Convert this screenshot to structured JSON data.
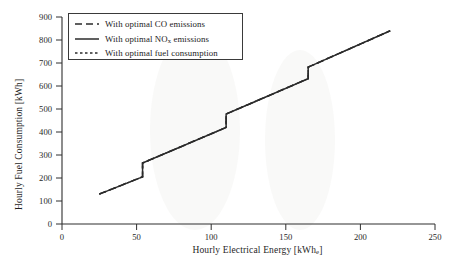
{
  "chart_data": {
    "type": "line",
    "title": "",
    "xlabel": "Hourly Electrical Energy [kWhe]",
    "ylabel": "Hourly Fuel Consumption [kWh]",
    "xlim": [
      0,
      250
    ],
    "ylim": [
      0,
      900
    ],
    "xticks": [
      0,
      50,
      100,
      150,
      200,
      250
    ],
    "yticks": [
      0,
      100,
      200,
      300,
      400,
      500,
      600,
      700,
      800,
      900
    ],
    "grid": false,
    "legend_position": "upper left",
    "series": [
      {
        "name": "With optimal CO emissions",
        "style": "dashed",
        "color": "#2b2b2b",
        "x": [
          25,
          54,
          54,
          110,
          110,
          165,
          165,
          220
        ],
        "y": [
          130,
          205,
          265,
          420,
          478,
          632,
          682,
          840
        ]
      },
      {
        "name": "With optimal NOx emissions",
        "style": "solid",
        "color": "#2b2b2b",
        "x": [
          25,
          54,
          54,
          110,
          110,
          165,
          165,
          220
        ],
        "y": [
          130,
          205,
          265,
          420,
          478,
          632,
          682,
          840
        ]
      },
      {
        "name": "With optimal fuel consumption",
        "style": "dotted",
        "color": "#2b2b2b",
        "x": [
          25,
          54,
          54,
          110,
          110,
          165,
          165,
          220
        ],
        "y": [
          130,
          205,
          265,
          420,
          478,
          632,
          682,
          840
        ]
      }
    ]
  },
  "axes": {
    "x_tick_labels": [
      "0",
      "50",
      "100",
      "150",
      "200",
      "250"
    ],
    "y_tick_labels": [
      "0",
      "100",
      "200",
      "300",
      "400",
      "500",
      "600",
      "700",
      "800",
      "900"
    ],
    "x_title_main": "Hourly Electrical Energy [kWh",
    "x_title_sub": "e",
    "x_title_tail": "]",
    "y_title": "Hourly Fuel Consumption [kWh]"
  },
  "legend": {
    "items": [
      {
        "label": "With optimal CO emissions",
        "style": "dashed"
      },
      {
        "label_pre": "With optimal NO",
        "label_sub": "x",
        "label_post": " emissions",
        "style": "solid"
      },
      {
        "label": "With optimal fuel consumption",
        "style": "dotted"
      }
    ]
  },
  "colors": {
    "line": "#2b2b2b",
    "axis": "#2f2f2f",
    "text": "#1f1f1f",
    "background": "#ffffff"
  }
}
